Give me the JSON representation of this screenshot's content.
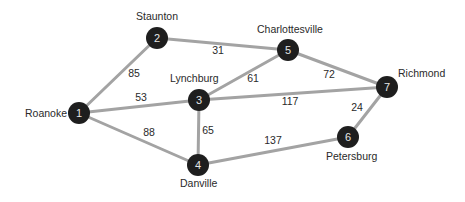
{
  "diagram": {
    "type": "weighted-undirected-graph",
    "colors": {
      "edge": "#a3a3a3",
      "node_fill": "#1e1e1e",
      "node_text": "#e6e6e6",
      "label_text": "#2a2a2a"
    },
    "nodes": [
      {
        "id": "1",
        "label": "1",
        "city": "Roanoke"
      },
      {
        "id": "2",
        "label": "2",
        "city": "Staunton"
      },
      {
        "id": "3",
        "label": "3",
        "city": "Lynchburg"
      },
      {
        "id": "4",
        "label": "4",
        "city": "Danville"
      },
      {
        "id": "5",
        "label": "5",
        "city": "Charlottesville"
      },
      {
        "id": "6",
        "label": "6",
        "city": "Petersburg"
      },
      {
        "id": "7",
        "label": "7",
        "city": "Richmond"
      }
    ],
    "edges": [
      {
        "from": "1",
        "to": "2",
        "weight": "85"
      },
      {
        "from": "1",
        "to": "3",
        "weight": "53"
      },
      {
        "from": "1",
        "to": "4",
        "weight": "88"
      },
      {
        "from": "2",
        "to": "5",
        "weight": "31"
      },
      {
        "from": "3",
        "to": "5",
        "weight": "61"
      },
      {
        "from": "3",
        "to": "4",
        "weight": "65"
      },
      {
        "from": "3",
        "to": "7",
        "weight": "117"
      },
      {
        "from": "5",
        "to": "7",
        "weight": "72"
      },
      {
        "from": "7",
        "to": "6",
        "weight": "24"
      },
      {
        "from": "4",
        "to": "6",
        "weight": "137"
      }
    ]
  }
}
